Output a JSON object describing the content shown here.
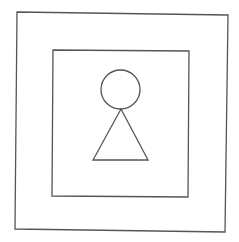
{
  "diagram": {
    "background": "#ffffff",
    "stroke_color": "#555555",
    "stroke_width": 1.3,
    "shapes": {
      "outer_square": {
        "points": "17,12 228,15 225,232 15,229"
      },
      "inner_square": {
        "points": "53,50 189,51 188,197 52,196"
      },
      "head_circle": {
        "cx": 120.5,
        "cy": 89.5,
        "r": 19.5
      },
      "body_triangle": {
        "points": "121,109 148,160 93,160"
      }
    }
  }
}
